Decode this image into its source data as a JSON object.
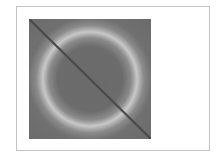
{
  "figure": {
    "colors": {
      "background": "#6b6b6b",
      "ring": "#c8c8c8",
      "diagonal": "#4a4a4a",
      "frame_border": "#c4c4c4"
    }
  }
}
